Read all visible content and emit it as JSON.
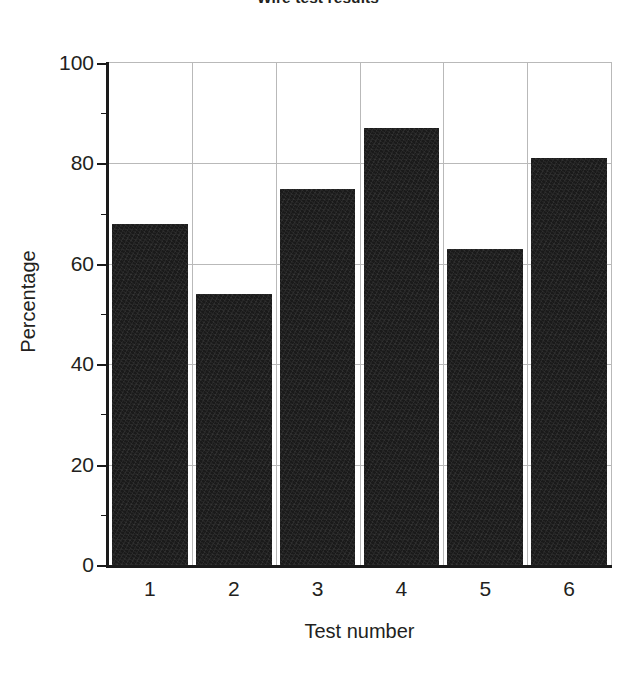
{
  "chart_data": {
    "type": "bar",
    "title": "Wire test results",
    "xlabel": "Test number",
    "ylabel": "Percentage",
    "categories": [
      "1",
      "2",
      "3",
      "4",
      "5",
      "6"
    ],
    "values": [
      68,
      54,
      75,
      87,
      63,
      81
    ],
    "ylim": [
      0,
      100
    ],
    "ytick_labels": [
      "100",
      "80",
      "60",
      "40",
      "20",
      "0"
    ],
    "ytick_values": [
      100,
      80,
      60,
      40,
      20,
      0
    ],
    "yminor_tick_values": [
      90,
      70,
      50,
      30,
      10
    ],
    "ytick_step": 20,
    "grid": "both",
    "legend": "none",
    "bar_color": "#1a1a1a",
    "grid_color": "#b9b9b9",
    "axis_color": "#1a1a1a",
    "background_color": "#ffffff"
  }
}
